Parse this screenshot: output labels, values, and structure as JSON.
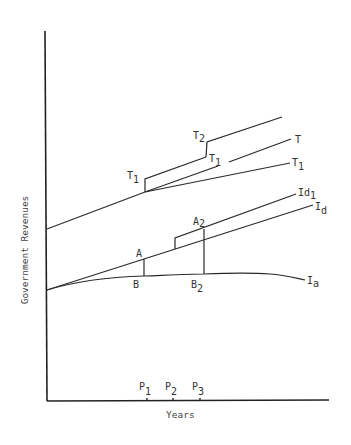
{
  "axes": {
    "y_label": "Government Revenues",
    "x_label": "Years"
  },
  "curves": {
    "T2": {
      "base": "T",
      "sub": "2"
    },
    "T": {
      "base": "T",
      "sub": ""
    },
    "T1_mid": {
      "base": "T",
      "sub": "1"
    },
    "T1_right": {
      "base": "T",
      "sub": "1"
    },
    "T1_left": {
      "base": "T",
      "sub": "1"
    },
    "Id1": {
      "base": "Id",
      "sub": "1"
    },
    "Id": {
      "base": "I",
      "sub": "d"
    },
    "Ia": {
      "base": "I",
      "sub": "a"
    }
  },
  "points": {
    "A": {
      "base": "A",
      "sub": ""
    },
    "A2": {
      "base": "A",
      "sub": "2"
    },
    "B": {
      "base": "B",
      "sub": ""
    },
    "B2": {
      "base": "B",
      "sub": "2"
    }
  },
  "x_ticks": [
    {
      "base": "P",
      "sub": "1"
    },
    {
      "base": "P",
      "sub": "2"
    },
    {
      "base": "P",
      "sub": "3"
    }
  ]
}
